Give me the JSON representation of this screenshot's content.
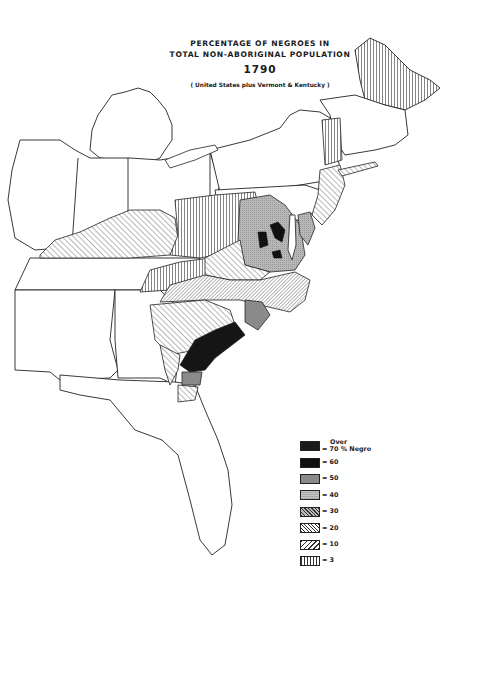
{
  "title": {
    "line1": "PERCENTAGE OF NEGROES IN",
    "line2": "TOTAL NON-ABORIGINAL POPULATION",
    "year": "1790",
    "subtitle": "( United States plus Vermont & Kentucky )"
  },
  "legend": {
    "items": [
      {
        "prefix": "Over",
        "label": "= 70 % Negro",
        "fill": "#1a1a1a",
        "pattern": "solid-black"
      },
      {
        "label": "= 60",
        "fill": "#111111",
        "pattern": "solid-black"
      },
      {
        "label": "= 50",
        "fill": "#8a8a8a",
        "pattern": "solid-dark-gray"
      },
      {
        "label": "= 40",
        "fill": "#b4b4b4",
        "pattern": "stipple-gray"
      },
      {
        "label": "= 30",
        "fill": "#9a9a9a",
        "pattern": "cross-hatch"
      },
      {
        "label": "= 20",
        "fill": "#ffffff",
        "pattern": "dense-diagonal"
      },
      {
        "label": "= 10",
        "fill": "#ffffff",
        "pattern": "sparse-diagonal"
      },
      {
        "label": "= 3",
        "fill": "#ffffff",
        "pattern": "vertical-lines"
      }
    ]
  },
  "colors": {
    "ink": "#1a1a1a",
    "paper": "#ffffff",
    "gray50": "#8a8a8a",
    "gray40": "#b4b4b4"
  }
}
